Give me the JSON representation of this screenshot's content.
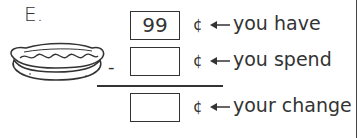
{
  "problem": {
    "label": "E.",
    "item_image": "hot-dog",
    "operator": "-",
    "rows": [
      {
        "value": "99",
        "unit": "¢",
        "description": "you have"
      },
      {
        "value": "",
        "unit": "¢",
        "description": "you spend"
      },
      {
        "value": "",
        "unit": "¢",
        "description": "your change"
      }
    ]
  }
}
